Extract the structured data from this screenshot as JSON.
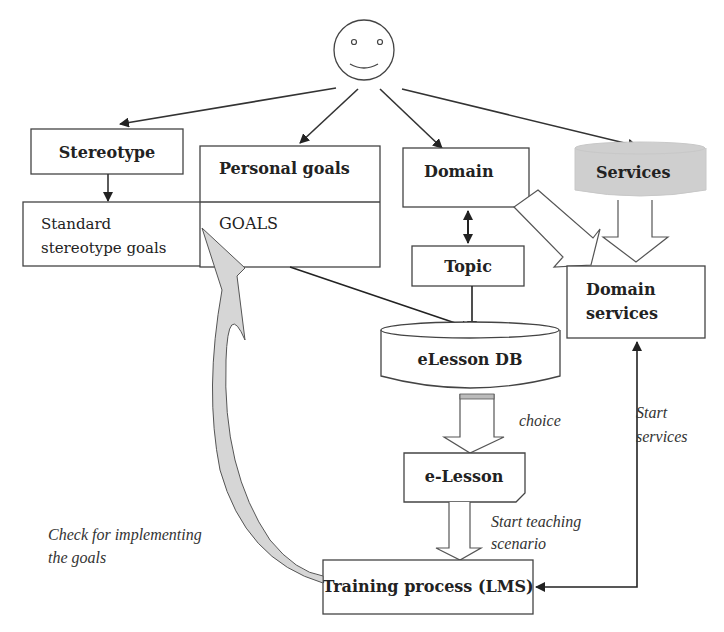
{
  "diagram": {
    "actor": {
      "icon": "smiley-face-icon"
    },
    "nodes": {
      "stereotype": "Stereotype",
      "standard_goals_line1": "Standard",
      "standard_goals_line2": "stereotype goals",
      "personal_goals": "Personal goals",
      "goals": "GOALS",
      "domain": "Domain",
      "services": "Services",
      "topic": "Topic",
      "domain_services_line1": "Domain",
      "domain_services_line2": "services",
      "elesson_db": "eLesson DB",
      "elesson": "e-Lesson",
      "training_process": "Training process (LMS)"
    },
    "edge_labels": {
      "choice": "choice",
      "start_services_line1": "Start",
      "start_services_line2": "services",
      "start_teaching_line1": "Start teaching",
      "start_teaching_line2": "scenario",
      "check_goals_line1": "Check for implementing",
      "check_goals_line2": "the goals"
    },
    "colors": {
      "line": "#333333",
      "services_fill": "#cfcfcf",
      "curve_fill": "#d6d6d6"
    }
  }
}
